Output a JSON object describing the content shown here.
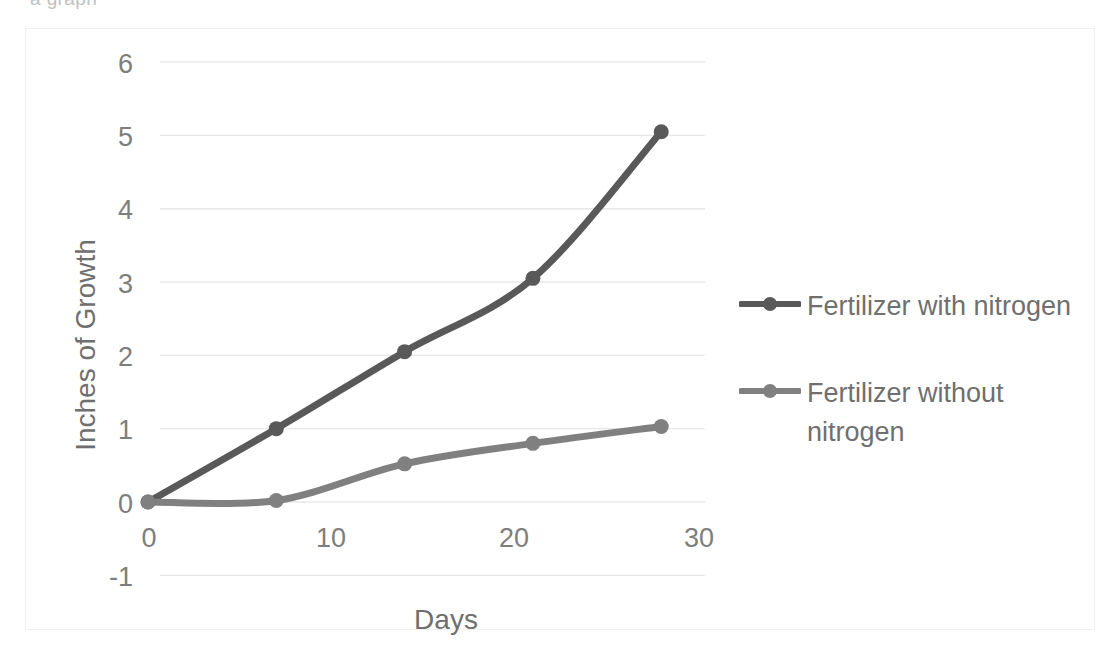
{
  "scan_artifact": {
    "clipped_text": "a graph"
  },
  "chart_data": {
    "type": "line",
    "title": "",
    "xlabel": "Days",
    "ylabel": "Inches of Growth",
    "x": [
      0,
      7,
      14,
      21,
      28
    ],
    "xlim": [
      0,
      30
    ],
    "ylim": [
      -1,
      6
    ],
    "xticks": [
      "0",
      "10",
      "20",
      "30"
    ],
    "xtick_values": [
      0,
      10,
      20,
      30
    ],
    "yticks": [
      "6",
      "5",
      "4",
      "3",
      "2",
      "1",
      "0",
      "-1"
    ],
    "ytick_values": [
      6,
      5,
      4,
      3,
      2,
      1,
      0,
      -1
    ],
    "grid": "horizontal",
    "smoothing": true,
    "markers": "circle",
    "legend_position": "right",
    "series": [
      {
        "name": "Fertilizer with nitrogen",
        "values": [
          0,
          1.0,
          2.05,
          3.05,
          5.05
        ],
        "color": "#595959"
      },
      {
        "name": "Fertilizer without nitrogen",
        "values": [
          0,
          0.02,
          0.52,
          0.8,
          1.03
        ],
        "color": "#808080"
      }
    ]
  },
  "axes": {
    "y": {
      "title": "Inches of Growth",
      "labels": [
        "6",
        "5",
        "4",
        "3",
        "2",
        "1",
        "0",
        "-1"
      ]
    },
    "x": {
      "title": "Days",
      "labels": [
        "0",
        "10",
        "20",
        "30"
      ]
    }
  },
  "legend": {
    "items": [
      {
        "label": "Fertilizer with nitrogen",
        "color": "#595959"
      },
      {
        "label": "Fertilizer without nitrogen",
        "color": "#808080"
      }
    ]
  },
  "colors": {
    "gridline": "#e8e8e8",
    "frame_border": "#f0f0f0",
    "tick_text": "#7e7e7e",
    "title_text": "#6f6f6f",
    "series_1": "#595959",
    "series_2": "#808080",
    "background": "#ffffff"
  }
}
